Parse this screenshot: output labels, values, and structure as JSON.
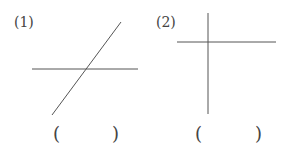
{
  "figures": [
    {
      "label": "(1)",
      "answer_open": "(",
      "answer_close": ")",
      "lines": [
        {
          "x1": 32,
          "y1": 69,
          "x2": 138,
          "y2": 69
        },
        {
          "x1": 52,
          "y1": 115,
          "x2": 121,
          "y2": 22
        }
      ]
    },
    {
      "label": "(2)",
      "answer_open": "(",
      "answer_close": ")",
      "lines": [
        {
          "x1": 177,
          "y1": 42,
          "x2": 276,
          "y2": 42
        },
        {
          "x1": 208,
          "y1": 13,
          "x2": 208,
          "y2": 114
        }
      ]
    }
  ],
  "colors": {
    "line": "#555555"
  }
}
